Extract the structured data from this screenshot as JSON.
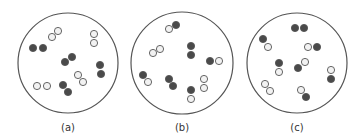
{
  "figure": {
    "colors": {
      "background": "#ffffff",
      "outline": "#555555",
      "dark_atom": "#4a4a4a",
      "light_atom": "#f2f2f2",
      "atom_stroke": "#555555",
      "label": "#333333"
    },
    "atom_radius": 3.6,
    "panels": [
      {
        "label": "(a)",
        "circle": {
          "cx": 68,
          "cy": 63,
          "r": 50
        },
        "label_pos": {
          "x": 68,
          "y": 131
        },
        "molecules": [
          {
            "atoms": [
              {
                "x": 52,
                "y": 37,
                "type": "light"
              },
              {
                "x": 58,
                "y": 31,
                "type": "light"
              }
            ]
          },
          {
            "atoms": [
              {
                "x": 33,
                "y": 48,
                "type": "dark"
              },
              {
                "x": 43,
                "y": 48,
                "type": "dark"
              }
            ]
          },
          {
            "atoms": [
              {
                "x": 94,
                "y": 34,
                "type": "light"
              },
              {
                "x": 94,
                "y": 43,
                "type": "light"
              }
            ]
          },
          {
            "atoms": [
              {
                "x": 65,
                "y": 62,
                "type": "dark"
              },
              {
                "x": 72,
                "y": 57,
                "type": "dark"
              }
            ]
          },
          {
            "atoms": [
              {
                "x": 100,
                "y": 65,
                "type": "dark"
              },
              {
                "x": 101,
                "y": 74,
                "type": "dark"
              }
            ]
          },
          {
            "atoms": [
              {
                "x": 78,
                "y": 75,
                "type": "light"
              },
              {
                "x": 83,
                "y": 82,
                "type": "light"
              }
            ]
          },
          {
            "atoms": [
              {
                "x": 37,
                "y": 86,
                "type": "light"
              },
              {
                "x": 47,
                "y": 86,
                "type": "light"
              }
            ]
          },
          {
            "atoms": [
              {
                "x": 63,
                "y": 85,
                "type": "dark"
              },
              {
                "x": 68,
                "y": 92,
                "type": "dark"
              }
            ]
          }
        ]
      },
      {
        "label": "(b)",
        "circle": {
          "cx": 182,
          "cy": 63,
          "r": 51
        },
        "label_pos": {
          "x": 182,
          "y": 131
        },
        "molecules": [
          {
            "atoms": [
              {
                "x": 169,
                "y": 29,
                "type": "light"
              },
              {
                "x": 176,
                "y": 25,
                "type": "dark"
              }
            ]
          },
          {
            "atoms": [
              {
                "x": 153,
                "y": 53,
                "type": "light"
              },
              {
                "x": 160,
                "y": 49,
                "type": "light"
              }
            ]
          },
          {
            "atoms": [
              {
                "x": 191,
                "y": 46,
                "type": "dark"
              },
              {
                "x": 191,
                "y": 55,
                "type": "dark"
              }
            ]
          },
          {
            "atoms": [
              {
                "x": 210,
                "y": 61,
                "type": "dark"
              },
              {
                "x": 219,
                "y": 61,
                "type": "light"
              }
            ]
          },
          {
            "atoms": [
              {
                "x": 143,
                "y": 75,
                "type": "dark"
              },
              {
                "x": 148,
                "y": 82,
                "type": "light"
              }
            ]
          },
          {
            "atoms": [
              {
                "x": 169,
                "y": 79,
                "type": "dark"
              },
              {
                "x": 173,
                "y": 86,
                "type": "dark"
              }
            ]
          },
          {
            "atoms": [
              {
                "x": 204,
                "y": 79,
                "type": "light"
              },
              {
                "x": 204,
                "y": 88,
                "type": "light"
              }
            ]
          },
          {
            "atoms": [
              {
                "x": 191,
                "y": 90,
                "type": "dark"
              },
              {
                "x": 191,
                "y": 99,
                "type": "light"
              }
            ]
          }
        ]
      },
      {
        "label": "(c)",
        "circle": {
          "cx": 297,
          "cy": 63,
          "r": 50
        },
        "label_pos": {
          "x": 297,
          "y": 131
        },
        "molecules": [
          {
            "atoms": [
              {
                "x": 295,
                "y": 28,
                "type": "dark"
              },
              {
                "x": 304,
                "y": 28,
                "type": "dark"
              }
            ]
          },
          {
            "atoms": [
              {
                "x": 263,
                "y": 39,
                "type": "dark"
              },
              {
                "x": 268,
                "y": 47,
                "type": "light"
              }
            ]
          },
          {
            "atoms": [
              {
                "x": 308,
                "y": 47,
                "type": "light"
              },
              {
                "x": 317,
                "y": 47,
                "type": "dark"
              }
            ]
          },
          {
            "atoms": [
              {
                "x": 279,
                "y": 63,
                "type": "dark"
              },
              {
                "x": 279,
                "y": 72,
                "type": "light"
              }
            ]
          },
          {
            "atoms": [
              {
                "x": 298,
                "y": 68,
                "type": "dark"
              },
              {
                "x": 305,
                "y": 62,
                "type": "light"
              }
            ]
          },
          {
            "atoms": [
              {
                "x": 331,
                "y": 70,
                "type": "light"
              },
              {
                "x": 331,
                "y": 79,
                "type": "dark"
              }
            ]
          },
          {
            "atoms": [
              {
                "x": 265,
                "y": 84,
                "type": "light"
              },
              {
                "x": 270,
                "y": 91,
                "type": "light"
              }
            ]
          },
          {
            "atoms": [
              {
                "x": 301,
                "y": 90,
                "type": "light"
              },
              {
                "x": 306,
                "y": 97,
                "type": "dark"
              }
            ]
          }
        ]
      }
    ]
  }
}
